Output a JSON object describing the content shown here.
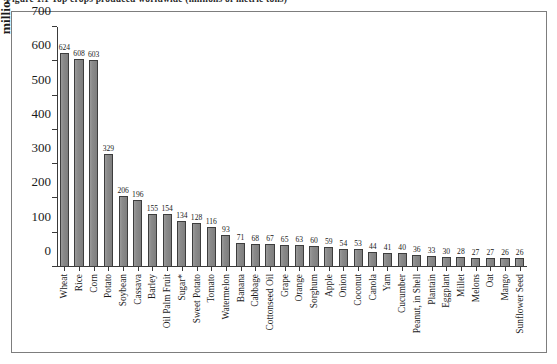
{
  "figure": {
    "caption": "Figure 1.1  Top crops produced worldwide (millions of metric tons)"
  },
  "chart_data": {
    "type": "bar",
    "title": "",
    "xlabel": "",
    "ylabel": "millions of metric tons",
    "ylim": [
      0,
      700
    ],
    "yticks": [
      0,
      100,
      200,
      300,
      400,
      500,
      600,
      700
    ],
    "grid": false,
    "legend": "none",
    "bar_color": "#8a8a8a",
    "bar_edge_color": "#3d3d3d",
    "categories": [
      "Wheat",
      "Rice",
      "Corn",
      "Potato",
      "Soybean",
      "Cassava",
      "Barley",
      "Oil Palm Fruit",
      "Sugar*",
      "Sweet Potato",
      "Tomato",
      "Watermelon",
      "Banana",
      "Cabbage",
      "Cottonseed Oil",
      "Grape",
      "Orange",
      "Sorghum",
      "Apple",
      "Onion",
      "Coconut",
      "Canola",
      "Yam",
      "Cucumber",
      "Peanut, in Shell",
      "Plantain",
      "Eggplant",
      "Millet",
      "Melons",
      "Oat",
      "Mango",
      "Sunflower Seed"
    ],
    "values": [
      624,
      608,
      603,
      329,
      206,
      196,
      155,
      154,
      134,
      128,
      116,
      93,
      71,
      68,
      67,
      65,
      63,
      60,
      59,
      54,
      53,
      44,
      41,
      40,
      36,
      33,
      30,
      28,
      27,
      27,
      26,
      26
    ],
    "value_labels": [
      "624",
      "608",
      "603",
      "329",
      "206",
      "196",
      "155",
      "154",
      "134",
      "128",
      "116",
      "93",
      "71",
      "68",
      "67",
      "65",
      "63",
      "60",
      "59",
      "54",
      "53",
      "44",
      "41",
      "40",
      "36",
      "33",
      "30",
      "28",
      "27",
      "27",
      "26",
      "26"
    ]
  }
}
